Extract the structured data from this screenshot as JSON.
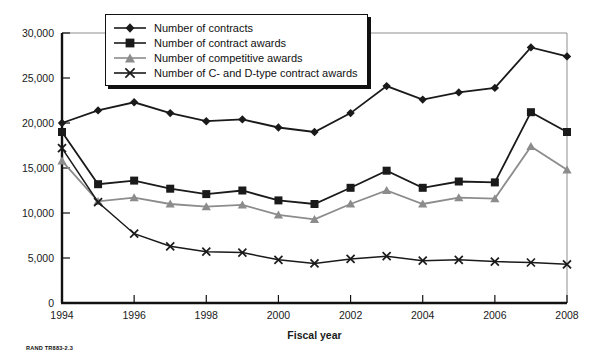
{
  "source_note": "RAND TR883-2.3",
  "legend": {
    "items": [
      {
        "label": "Number of contracts",
        "marker": "diamond-marker",
        "color": "#1a1a1a"
      },
      {
        "label": "Number of contract awards",
        "marker": "square-marker",
        "color": "#1a1a1a"
      },
      {
        "label": "Number of competitive awards",
        "marker": "triangle-marker",
        "color": "#8c8c8c"
      },
      {
        "label": "Number of C- and D-type contract awards",
        "marker": "x-marker",
        "color": "#1a1a1a"
      }
    ]
  },
  "chart_data": {
    "type": "line",
    "title": "",
    "xlabel": "Fiscal year",
    "ylabel": "",
    "x": [
      1994,
      1995,
      1996,
      1997,
      1998,
      1999,
      2000,
      2001,
      2002,
      2003,
      2004,
      2005,
      2006,
      2007,
      2008
    ],
    "xlim": [
      1994,
      2008
    ],
    "ylim": [
      0,
      30000
    ],
    "xticks": [
      1994,
      1996,
      1998,
      2000,
      2002,
      2004,
      2006,
      2008
    ],
    "xtick_labels": [
      "1994",
      "1996",
      "1998",
      "2000",
      "2002",
      "2004",
      "2006",
      "2008"
    ],
    "yticks": [
      0,
      5000,
      10000,
      15000,
      20000,
      25000,
      30000
    ],
    "ytick_labels": [
      "0",
      "5,000",
      "10,000",
      "15,000",
      "20,000",
      "25,000",
      "30,000"
    ],
    "grid": false,
    "legend_position": "top-center",
    "series": [
      {
        "name": "Number of contracts",
        "marker": "diamond",
        "color": "#1a1a1a",
        "values": [
          20000,
          21400,
          22300,
          21100,
          20200,
          20400,
          19500,
          19000,
          21100,
          24100,
          22600,
          23400,
          23900,
          28400,
          27400
        ]
      },
      {
        "name": "Number of contract awards",
        "marker": "square",
        "color": "#1a1a1a",
        "values": [
          19000,
          13200,
          13600,
          12700,
          12100,
          12500,
          11400,
          11000,
          12800,
          14700,
          12800,
          13500,
          13400,
          21200,
          19000
        ]
      },
      {
        "name": "Number of competitive awards",
        "marker": "triangle",
        "color": "#8c8c8c",
        "values": [
          15800,
          11300,
          11700,
          11000,
          10700,
          10900,
          9800,
          9300,
          11000,
          12500,
          11000,
          11700,
          11600,
          17400,
          14800
        ]
      },
      {
        "name": "Number of C- and D-type contract awards",
        "marker": "x",
        "color": "#1a1a1a",
        "values": [
          17200,
          11200,
          7700,
          6300,
          5700,
          5600,
          4800,
          4400,
          4900,
          5200,
          4700,
          4800,
          4600,
          4500,
          4300
        ]
      }
    ]
  }
}
